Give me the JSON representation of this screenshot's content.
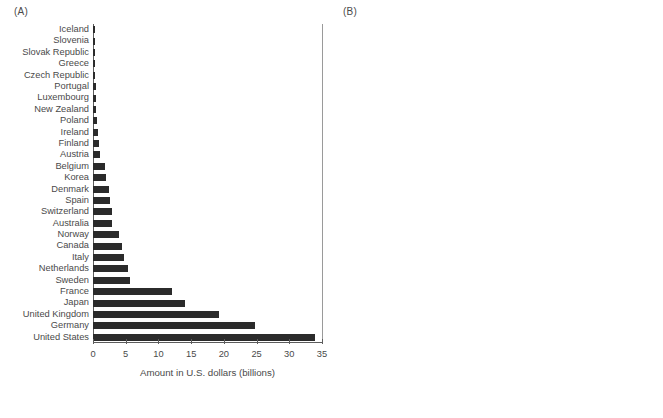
{
  "figure": {
    "panel_a_tag": "(A)",
    "panel_b_tag": "(B)"
  },
  "chart_data": [
    {
      "id": "panel-a",
      "type": "bar",
      "orientation": "horizontal",
      "title": "(A)",
      "xlabel": "Amount in U.S. dollars (billions)",
      "ylabel": "",
      "xlim": [
        0,
        35
      ],
      "xticks": [
        0,
        5,
        10,
        15,
        20,
        25,
        30,
        35
      ],
      "xticklabels": [
        "0",
        "5",
        "10",
        "15",
        "20",
        "25",
        "30",
        "35"
      ],
      "grid": false,
      "bar_color": "#2b2b2b",
      "categories": [
        "Iceland",
        "Slovenia",
        "Slovak Republic",
        "Greece",
        "Czech Republic",
        "Portugal",
        "Luxembourg",
        "New Zealand",
        "Poland",
        "Ireland",
        "Finland",
        "Austria",
        "Belgium",
        "Korea",
        "Denmark",
        "Spain",
        "Switzerland",
        "Australia",
        "Norway",
        "Canada",
        "Italy",
        "Netherlands",
        "Sweden",
        "France",
        "Japan",
        "United Kingdom",
        "Germany",
        "United States"
      ],
      "values": [
        0.04,
        0.06,
        0.08,
        0.24,
        0.25,
        0.45,
        0.46,
        0.5,
        0.62,
        0.81,
        0.97,
        1.1,
        1.8,
        2.0,
        2.4,
        2.6,
        2.9,
        2.9,
        4.0,
        4.4,
        4.7,
        5.4,
        5.6,
        12.0,
        14.0,
        19.3,
        24.8,
        34.0
      ]
    },
    {
      "id": "panel-b",
      "type": "bar",
      "orientation": "horizontal",
      "title": "(B)",
      "xlabel": "Gross national income (%)",
      "ylabel": "",
      "xlim": [
        0,
        1.1
      ],
      "xticks": [
        0,
        0.2,
        0.4,
        0.6,
        0.8,
        1.0
      ],
      "xticklabels": [
        "0",
        "0.2",
        "0.4",
        "0.6",
        "0.8",
        "1.0"
      ],
      "grid": false,
      "bar_color": "#6d6d6d",
      "annotation": {
        "text": "UN target – 0.7%",
        "value": 0.7,
        "line_style": "dashed"
      },
      "categories": [
        "Slovak Republic",
        "Greece",
        "Poland",
        "Czech Republic",
        "Korea",
        "Slovenia",
        "United States",
        "Portugal",
        "Spain",
        "Australia",
        "Italy",
        "Austria",
        "Japan",
        "Canada",
        "New Zealand",
        "DAC total",
        "Iceland",
        "Ireland",
        "Finland",
        "France",
        "Belgium",
        "Switzerland",
        "Netherlands",
        "Germany",
        "United Kingdom",
        "Denmark",
        "Norway",
        "Luxembourg",
        "Sweden"
      ],
      "values": [
        0.13,
        0.13,
        0.14,
        0.14,
        0.15,
        0.16,
        0.17,
        0.17,
        0.21,
        0.23,
        0.24,
        0.26,
        0.27,
        0.27,
        0.28,
        0.31,
        0.31,
        0.31,
        0.36,
        0.42,
        0.43,
        0.43,
        0.61,
        0.61,
        0.69,
        0.71,
        0.94,
        0.98,
        1.04
      ]
    }
  ]
}
